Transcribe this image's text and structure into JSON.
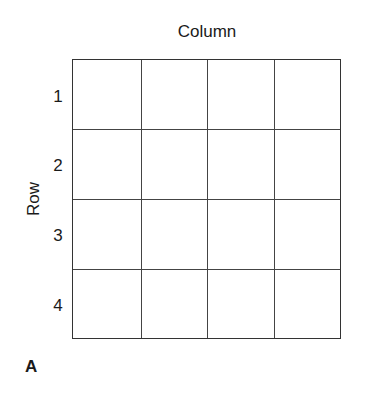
{
  "diagram": {
    "column_axis_label": "Column",
    "row_axis_label": "Row",
    "row_labels": [
      "1",
      "2",
      "3",
      "4"
    ],
    "rows": 4,
    "columns": 4,
    "panel_label": "A",
    "line_color": "#333333"
  }
}
